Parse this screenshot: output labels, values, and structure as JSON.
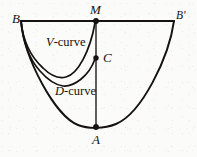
{
  "figure": {
    "kind": "geometric-diagram",
    "ink_color": "#15120f",
    "background_color": "#fbfbfa",
    "points": [
      {
        "id": "B",
        "label": "B",
        "x": 21,
        "y": 21,
        "label_x": 12,
        "label_y": 12,
        "dot": false
      },
      {
        "id": "M",
        "label": "M",
        "x": 96,
        "y": 21,
        "label_x": 91,
        "label_y": 4,
        "dot": true
      },
      {
        "id": "Bp",
        "label": "B'",
        "x": 174,
        "y": 21,
        "label_x": 176,
        "label_y": 11,
        "dot": false
      },
      {
        "id": "C",
        "label": "C",
        "x": 96,
        "y": 58,
        "label_x": 103,
        "label_y": 51,
        "dot": true
      },
      {
        "id": "A",
        "label": "A",
        "x": 96,
        "y": 127,
        "label_x": 92,
        "label_y": 133,
        "dot": true
      }
    ],
    "curve_labels": [
      {
        "id": "v-curve",
        "prefix": "V",
        "suffix": "-curve",
        "x": 46,
        "y": 36
      },
      {
        "id": "d-curve",
        "prefix": "D",
        "suffix": "-curve",
        "x": 55,
        "y": 85
      }
    ],
    "segments": [
      {
        "id": "top-chord",
        "from": "B",
        "to": "Bp",
        "width": 1.7
      },
      {
        "id": "vertical-axis",
        "from": "M",
        "to": "A",
        "width": 1.3
      }
    ],
    "curves": [
      {
        "id": "outer-parabola",
        "from": "B",
        "to": "Bp",
        "via": "A",
        "width": 1.9
      },
      {
        "id": "v-curve",
        "from": "B",
        "to": "M",
        "via": "minimum at (63,77)",
        "width": 1.7
      },
      {
        "id": "d-curve",
        "from": "B",
        "to": "C",
        "via": "minimum at (56,88)",
        "width": 1.7
      }
    ]
  }
}
